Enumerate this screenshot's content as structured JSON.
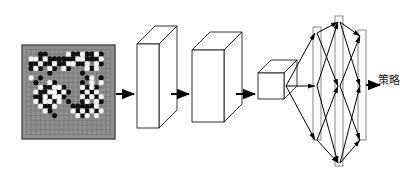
{
  "figure": {
    "name": "go-policy-network-architecture",
    "background_color": "#ffffff",
    "stroke_color": "#000000",
    "output_label": "策略"
  },
  "board": {
    "name": "go-board",
    "size": 19,
    "board_color": "#8f8f8f",
    "grid_color": "#6e6e6e",
    "border_color": "#4a4a4a",
    "black_stone_color": "#111111",
    "white_stone_color": "#f2f2f2",
    "x": 22,
    "y": 45,
    "width": 93,
    "height": 94,
    "black_stones": [
      [
        3,
        1
      ],
      [
        4,
        1
      ],
      [
        10,
        1
      ],
      [
        11,
        1
      ],
      [
        13,
        1
      ],
      [
        14,
        1
      ],
      [
        16,
        1
      ],
      [
        2,
        2
      ],
      [
        3,
        2
      ],
      [
        5,
        2
      ],
      [
        6,
        2
      ],
      [
        7,
        2
      ],
      [
        8,
        2
      ],
      [
        9,
        2
      ],
      [
        10,
        2
      ],
      [
        13,
        2
      ],
      [
        14,
        2
      ],
      [
        15,
        2
      ],
      [
        1,
        3
      ],
      [
        2,
        3
      ],
      [
        4,
        3
      ],
      [
        5,
        3
      ],
      [
        7,
        3
      ],
      [
        8,
        3
      ],
      [
        11,
        3
      ],
      [
        12,
        3
      ],
      [
        16,
        3
      ],
      [
        1,
        4
      ],
      [
        3,
        4
      ],
      [
        6,
        4
      ],
      [
        9,
        4
      ],
      [
        14,
        4
      ],
      [
        5,
        5
      ],
      [
        12,
        5
      ],
      [
        3,
        6
      ],
      [
        13,
        6
      ],
      [
        16,
        6
      ],
      [
        2,
        7
      ],
      [
        6,
        7
      ],
      [
        12,
        7
      ],
      [
        4,
        8
      ],
      [
        5,
        8
      ],
      [
        8,
        8
      ],
      [
        13,
        8
      ],
      [
        15,
        8
      ],
      [
        3,
        9
      ],
      [
        4,
        9
      ],
      [
        7,
        9
      ],
      [
        9,
        9
      ],
      [
        12,
        9
      ],
      [
        14,
        9
      ],
      [
        2,
        10
      ],
      [
        3,
        10
      ],
      [
        5,
        10
      ],
      [
        8,
        10
      ],
      [
        13,
        10
      ],
      [
        15,
        10
      ],
      [
        3,
        11
      ],
      [
        6,
        11
      ],
      [
        9,
        11
      ],
      [
        12,
        11
      ],
      [
        16,
        11
      ],
      [
        4,
        12
      ],
      [
        5,
        12
      ],
      [
        10,
        12
      ],
      [
        11,
        12
      ],
      [
        12,
        12
      ],
      [
        13,
        12
      ],
      [
        14,
        12
      ],
      [
        5,
        13
      ],
      [
        11,
        13
      ],
      [
        13,
        13
      ],
      [
        15,
        13
      ],
      [
        6,
        14
      ],
      [
        12,
        14
      ]
    ],
    "white_stones": [
      [
        9,
        1
      ],
      [
        12,
        1
      ],
      [
        15,
        1
      ],
      [
        1,
        2
      ],
      [
        2,
        2
      ],
      [
        4,
        2
      ],
      [
        11,
        2
      ],
      [
        12,
        2
      ],
      [
        16,
        2
      ],
      [
        3,
        3
      ],
      [
        6,
        3
      ],
      [
        9,
        3
      ],
      [
        10,
        3
      ],
      [
        13,
        3
      ],
      [
        15,
        3
      ],
      [
        2,
        4
      ],
      [
        5,
        4
      ],
      [
        8,
        4
      ],
      [
        13,
        4
      ],
      [
        15,
        4
      ],
      [
        1,
        6
      ],
      [
        14,
        6
      ],
      [
        5,
        7
      ],
      [
        14,
        7
      ],
      [
        16,
        7
      ],
      [
        3,
        8
      ],
      [
        6,
        8
      ],
      [
        7,
        8
      ],
      [
        12,
        8
      ],
      [
        14,
        8
      ],
      [
        2,
        9
      ],
      [
        5,
        9
      ],
      [
        6,
        9
      ],
      [
        8,
        9
      ],
      [
        13,
        9
      ],
      [
        15,
        9
      ],
      [
        4,
        10
      ],
      [
        6,
        10
      ],
      [
        7,
        10
      ],
      [
        12,
        10
      ],
      [
        14,
        10
      ],
      [
        16,
        10
      ],
      [
        2,
        11
      ],
      [
        4,
        11
      ],
      [
        5,
        11
      ],
      [
        7,
        11
      ],
      [
        13,
        11
      ],
      [
        15,
        11
      ],
      [
        3,
        12
      ],
      [
        6,
        12
      ],
      [
        15,
        12
      ],
      [
        4,
        13
      ],
      [
        10,
        13
      ],
      [
        12,
        13
      ],
      [
        14,
        13
      ],
      [
        16,
        13
      ],
      [
        11,
        14
      ],
      [
        13,
        14
      ],
      [
        15,
        14
      ]
    ]
  },
  "layers": [
    {
      "name": "conv-block-1",
      "shape": "cuboid",
      "x": 137,
      "y": 44,
      "width": 22,
      "height": 84,
      "depth": 18
    },
    {
      "name": "conv-block-2",
      "shape": "cuboid",
      "x": 192,
      "y": 50,
      "width": 32,
      "height": 72,
      "depth": 18
    },
    {
      "name": "conv-block-3",
      "shape": "cuboid",
      "x": 258,
      "y": 73,
      "width": 26,
      "height": 26,
      "depth": 13
    },
    {
      "name": "fc-layer-1",
      "shape": "plate",
      "x": 313,
      "y": 27,
      "width": 8,
      "height": 113
    },
    {
      "name": "fc-layer-2",
      "shape": "plate",
      "x": 335,
      "y": 16,
      "width": 8,
      "height": 150
    },
    {
      "name": "fc-layer-3",
      "shape": "plate",
      "x": 358,
      "y": 30,
      "width": 8,
      "height": 110
    }
  ],
  "arrows": [
    {
      "name": "arrow-board-to-conv1",
      "x1": 116,
      "y1": 94,
      "x2": 134,
      "y2": 94
    },
    {
      "name": "arrow-conv1-to-conv2",
      "x1": 171,
      "y1": 94,
      "x2": 189,
      "y2": 94
    },
    {
      "name": "arrow-conv2-to-conv3",
      "x1": 236,
      "y1": 94,
      "x2": 255,
      "y2": 94
    },
    {
      "name": "arrow-fc3-to-output",
      "x1": 366,
      "y1": 85,
      "x2": 380,
      "y2": 85
    }
  ],
  "connections": [
    {
      "name": "conn-cube-to-fc1-top",
      "x1": 286,
      "y1": 86,
      "x2": 315,
      "y2": 33
    },
    {
      "name": "conn-cube-to-fc1-mid",
      "x1": 286,
      "y1": 86,
      "x2": 315,
      "y2": 86
    },
    {
      "name": "conn-cube-to-fc1-bottom",
      "x1": 286,
      "y1": 86,
      "x2": 315,
      "y2": 140
    },
    {
      "name": "conn-fc1-top-to-fc2-mid",
      "x1": 317,
      "y1": 33,
      "x2": 338,
      "y2": 86
    },
    {
      "name": "conn-fc1-mid-to-fc2-top",
      "x1": 317,
      "y1": 86,
      "x2": 338,
      "y2": 22
    },
    {
      "name": "conn-fc1-mid-to-fc2-bottom",
      "x1": 317,
      "y1": 86,
      "x2": 338,
      "y2": 163
    },
    {
      "name": "conn-fc1-bottom-to-fc2-mid",
      "x1": 317,
      "y1": 140,
      "x2": 338,
      "y2": 86
    },
    {
      "name": "conn-fc1-top-to-fc2-top",
      "x1": 317,
      "y1": 33,
      "x2": 338,
      "y2": 22
    },
    {
      "name": "conn-fc1-bottom-to-fc2-bottom",
      "x1": 317,
      "y1": 140,
      "x2": 338,
      "y2": 163
    },
    {
      "name": "conn-fc2-top-to-fc3-mid",
      "x1": 340,
      "y1": 22,
      "x2": 360,
      "y2": 86
    },
    {
      "name": "conn-fc2-mid-to-fc3-top",
      "x1": 340,
      "y1": 86,
      "x2": 360,
      "y2": 36
    },
    {
      "name": "conn-fc2-mid-to-fc3-bottom",
      "x1": 340,
      "y1": 86,
      "x2": 360,
      "y2": 140
    },
    {
      "name": "conn-fc2-bottom-to-fc3-mid",
      "x1": 340,
      "y1": 163,
      "x2": 360,
      "y2": 86
    },
    {
      "name": "conn-fc2-top-to-fc3-top",
      "x1": 340,
      "y1": 22,
      "x2": 360,
      "y2": 36
    },
    {
      "name": "conn-fc2-bottom-to-fc3-bottom",
      "x1": 340,
      "y1": 163,
      "x2": 360,
      "y2": 140
    }
  ]
}
